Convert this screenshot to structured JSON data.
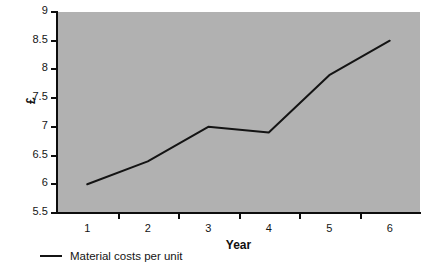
{
  "chart_data": {
    "type": "line",
    "title": "",
    "xlabel": "Year",
    "ylabel": "£",
    "categories": [
      "1",
      "2",
      "3",
      "4",
      "5",
      "6"
    ],
    "x": [
      1,
      2,
      3,
      4,
      5,
      6
    ],
    "values": [
      6.0,
      6.4,
      7.0,
      6.9,
      7.9,
      8.5
    ],
    "series": [
      {
        "name": "Material costs per unit",
        "values": [
          6.0,
          6.4,
          7.0,
          6.9,
          7.9,
          8.5
        ]
      }
    ],
    "ylim": [
      5.5,
      9
    ],
    "xlim": [
      0.5,
      6.5
    ],
    "yticks": [
      "5.5",
      "6",
      "6.5",
      "7",
      "7.5",
      "8",
      "8.5",
      "9"
    ],
    "ytick_values": [
      5.5,
      6,
      6.5,
      7,
      7.5,
      8,
      8.5,
      9
    ],
    "xticks": [
      "1",
      "2",
      "3",
      "4",
      "5",
      "6"
    ],
    "grid": false,
    "legend_position": "below-left",
    "legend": [
      "Material costs per unit"
    ],
    "colors": {
      "plot_background": "#b1b1b1",
      "axis": "#0d0d0d",
      "series_line": "#141414",
      "page_background": "#ffffff"
    }
  }
}
